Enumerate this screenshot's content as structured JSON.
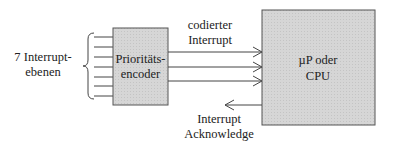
{
  "diagram": {
    "inputs": {
      "label_line1": "7 Interrupt-",
      "label_line2": "ebenen",
      "count": 7
    },
    "encoder": {
      "label_line1": "Prioritäts-",
      "label_line2": "encoder"
    },
    "encoded_signal": {
      "label_line1": "codierter",
      "label_line2": "Interrupt",
      "line_count": 3
    },
    "cpu": {
      "label_line1": "µP oder",
      "label_line2": "CPU"
    },
    "acknowledge": {
      "label_line1": "Interrupt",
      "label_line2": "Acknowledge"
    },
    "colors": {
      "box_fill": "#d4d4d4",
      "stroke": "#444444"
    }
  }
}
